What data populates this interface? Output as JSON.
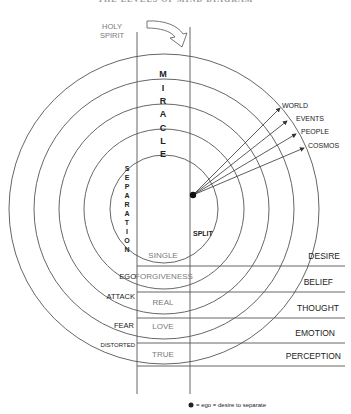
{
  "title": "THE LEVELS OF MIND DIAGRAM",
  "top_labels": {
    "holy_spirit_line1": "HOLY",
    "holy_spirit_line2": "SPIRIT"
  },
  "vertical_words": {
    "miracle": [
      "M",
      "I",
      "R",
      "A",
      "C",
      "L",
      "E"
    ],
    "separation": [
      "S",
      "E",
      "P",
      "A",
      "R",
      "A",
      "T",
      "I",
      "O",
      "N"
    ]
  },
  "split_label": "SPLIT",
  "projections": [
    "WORLD",
    "EVENTS",
    "PEOPLE",
    "COSMOS"
  ],
  "column_center": [
    "SINGLE",
    "FORGIVENESS",
    "REAL",
    "LOVE",
    "TRUE"
  ],
  "column_left": [
    "EGO",
    "ATTACK",
    "FEAR",
    "DISTORTED"
  ],
  "levels_right": [
    "DESIRE",
    "BELIEF",
    "THOUGHT",
    "EMOTION",
    "PERCEPTION"
  ],
  "legend": {
    "text": "= ego = desire to separate"
  },
  "colors": {
    "line": "#555555",
    "text": "#222222",
    "dim_text": "#7a7a7a"
  }
}
